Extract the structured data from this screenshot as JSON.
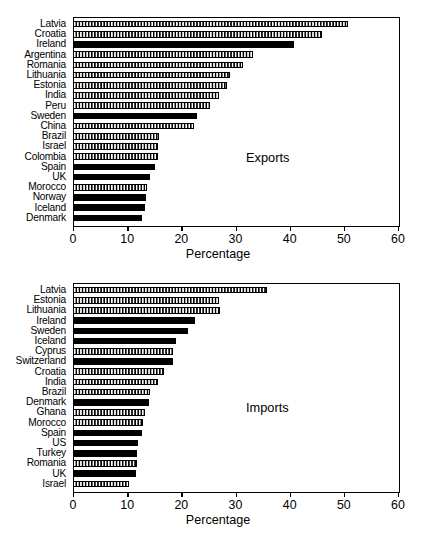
{
  "chart_data": [
    {
      "type": "bar",
      "orientation": "horizontal",
      "title": "",
      "annotation": "Exports",
      "xlabel": "Percentage",
      "ylabel": "",
      "xlim": [
        0,
        60
      ],
      "xticks": [
        0,
        10,
        20,
        30,
        40,
        50,
        60
      ],
      "xtick_labels": [
        "0",
        "10",
        "20",
        "30",
        "40",
        "50",
        "60"
      ],
      "grid": false,
      "legend": "none",
      "categories": [
        "Latvia",
        "Croatia",
        "Ireland",
        "Argentina",
        "Romania",
        "Lithuania",
        "Estonia",
        "India",
        "Peru",
        "Sweden",
        "China",
        "Brazil",
        "Israel",
        "Colombia",
        "Spain",
        "UK",
        "Morocco",
        "Norway",
        "Iceland",
        "Denmark"
      ],
      "values": [
        50.8,
        45.9,
        40.8,
        33.2,
        31.4,
        29.0,
        28.4,
        26.9,
        25.3,
        22.9,
        22.4,
        15.8,
        15.6,
        15.6,
        15.1,
        14.3,
        13.7,
        13.4,
        13.3,
        12.8
      ],
      "fills": [
        "hatched",
        "hatched",
        "solid",
        "hatched",
        "hatched",
        "hatched",
        "hatched",
        "hatched",
        "hatched",
        "solid",
        "hatched",
        "hatched",
        "hatched",
        "hatched",
        "solid",
        "solid",
        "hatched",
        "solid",
        "solid",
        "solid"
      ]
    },
    {
      "type": "bar",
      "orientation": "horizontal",
      "title": "",
      "annotation": "Imports",
      "xlabel": "Percentage",
      "ylabel": "",
      "xlim": [
        0,
        60
      ],
      "xticks": [
        0,
        10,
        20,
        30,
        40,
        50,
        60
      ],
      "xtick_labels": [
        "0",
        "10",
        "20",
        "30",
        "40",
        "50",
        "60"
      ],
      "grid": false,
      "legend": "none",
      "categories": [
        "Latvia",
        "Estonia",
        "Lithuania",
        "Ireland",
        "Sweden",
        "Iceland",
        "Cyprus",
        "Switzerland",
        "Croatia",
        "India",
        "Brazil",
        "Denmark",
        "Ghana",
        "Morocco",
        "Spain",
        "US",
        "Turkey",
        "Romania",
        "UK",
        "Israel"
      ],
      "values": [
        35.8,
        27.0,
        27.1,
        22.5,
        21.3,
        19.1,
        18.4,
        18.4,
        16.8,
        15.6,
        14.3,
        14.0,
        13.3,
        13.0,
        12.8,
        12.0,
        11.9,
        11.8,
        11.6,
        10.4
      ],
      "fills": [
        "hatched",
        "hatched",
        "hatched",
        "solid",
        "solid",
        "solid",
        "hatched",
        "solid",
        "hatched",
        "hatched",
        "hatched",
        "solid",
        "hatched",
        "hatched",
        "solid",
        "solid",
        "solid",
        "hatched",
        "solid",
        "hatched"
      ]
    }
  ],
  "colors": {
    "axis": "#000000",
    "bar_solid": "#000000",
    "bar_hatch_fill": "#ffffff",
    "background": "#ffffff"
  }
}
